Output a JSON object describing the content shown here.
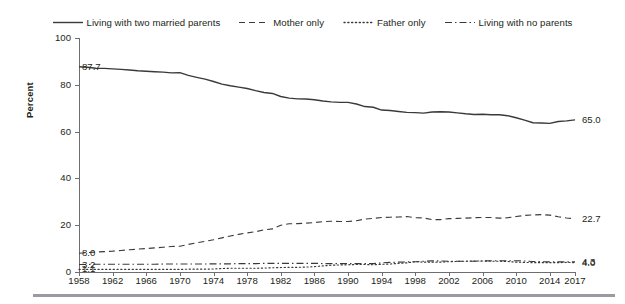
{
  "legend": {
    "items": [
      {
        "label": "Living with two married parents",
        "style": "solid",
        "icon": "solid-line-icon"
      },
      {
        "label": "Mother only",
        "style": "dashed",
        "icon": "dashed-line-icon"
      },
      {
        "label": "Father only",
        "style": "dotted",
        "icon": "dotted-line-icon"
      },
      {
        "label": "Living with no parents",
        "style": "dashdot",
        "icon": "dash-dot-line-icon"
      }
    ]
  },
  "axes": {
    "ylabel": "Percent",
    "yticks": [
      "0",
      "20",
      "40",
      "60",
      "80",
      "100"
    ],
    "xticks": [
      "1958",
      "1962",
      "1966",
      "1970",
      "1974",
      "1978",
      "1982",
      "1986",
      "1990",
      "1994",
      "1998",
      "2002",
      "2006",
      "2010",
      "2014",
      "2017"
    ]
  },
  "endpoint_labels": {
    "left": [
      {
        "series": "Living with two married parents",
        "value": "87.7"
      },
      {
        "series": "Mother only",
        "value": "8.0"
      },
      {
        "series": "Living with no parents",
        "value": "3.2"
      },
      {
        "series": "Father only",
        "value": "1.1"
      }
    ],
    "right": [
      {
        "series": "Living with two married parents",
        "value": "65.0"
      },
      {
        "series": "Mother only",
        "value": "22.7"
      },
      {
        "series": "Living with no parents",
        "value": "4.3"
      },
      {
        "series": "Father only",
        "value": "4.0"
      }
    ]
  },
  "colors": {
    "line": "#3a3a3a",
    "axis": "#6d6e71",
    "text": "#231f20",
    "rule": "#9a9b9e",
    "background": "#ffffff"
  },
  "chart_data": {
    "type": "line",
    "title": "",
    "subtitle": "",
    "xlabel": "",
    "ylabel": "Percent",
    "xlim": [
      1958,
      2017
    ],
    "ylim": [
      0,
      100
    ],
    "grid": false,
    "legend_position": "top-center",
    "x": [
      1958,
      1959,
      1960,
      1961,
      1962,
      1963,
      1964,
      1965,
      1966,
      1967,
      1968,
      1969,
      1970,
      1971,
      1972,
      1973,
      1974,
      1975,
      1976,
      1977,
      1978,
      1979,
      1980,
      1981,
      1982,
      1983,
      1984,
      1985,
      1986,
      1987,
      1988,
      1989,
      1990,
      1991,
      1992,
      1993,
      1994,
      1995,
      1996,
      1997,
      1998,
      1999,
      2000,
      2001,
      2002,
      2003,
      2004,
      2005,
      2006,
      2007,
      2008,
      2009,
      2010,
      2011,
      2012,
      2013,
      2014,
      2015,
      2016,
      2017
    ],
    "series": [
      {
        "name": "Living with two married parents",
        "style": "solid",
        "start_value": 87.7,
        "end_value": 65.0,
        "values": [
          87.7,
          87.5,
          87.1,
          87.0,
          86.8,
          86.6,
          86.3,
          86.0,
          85.8,
          85.6,
          85.4,
          85.1,
          85.2,
          84.0,
          83.2,
          82.4,
          81.4,
          80.3,
          79.6,
          79.0,
          78.4,
          77.5,
          76.7,
          76.3,
          75.0,
          74.3,
          74.0,
          73.9,
          73.6,
          73.1,
          72.7,
          72.5,
          72.5,
          71.8,
          70.7,
          70.4,
          69.2,
          69.0,
          68.6,
          68.2,
          68.1,
          67.9,
          68.4,
          68.5,
          68.4,
          68.0,
          67.6,
          67.3,
          67.4,
          67.2,
          67.2,
          66.8,
          65.9,
          64.9,
          63.8,
          63.7,
          63.5,
          64.3,
          64.6,
          65.0
        ]
      },
      {
        "name": "Mother only",
        "style": "dashed",
        "start_value": 8.0,
        "end_value": 22.7,
        "values": [
          8.0,
          8.3,
          8.5,
          8.7,
          8.9,
          9.2,
          9.5,
          9.8,
          10.0,
          10.3,
          10.6,
          10.9,
          11.0,
          11.8,
          12.5,
          13.1,
          13.8,
          14.6,
          15.4,
          16.1,
          16.7,
          17.2,
          18.0,
          18.4,
          20.0,
          20.6,
          20.7,
          20.9,
          21.1,
          21.5,
          21.7,
          21.6,
          21.6,
          21.9,
          22.6,
          22.9,
          23.3,
          23.4,
          23.5,
          23.7,
          23.2,
          23.1,
          22.4,
          22.4,
          22.8,
          22.9,
          23.0,
          23.2,
          23.3,
          23.3,
          23.0,
          23.2,
          23.7,
          24.2,
          24.4,
          24.5,
          24.3,
          23.6,
          23.1,
          22.7
        ]
      },
      {
        "name": "Father only",
        "style": "dotted",
        "start_value": 1.1,
        "end_value": 4.0,
        "values": [
          1.1,
          1.1,
          1.1,
          1.1,
          1.1,
          1.1,
          1.1,
          1.1,
          1.1,
          1.1,
          1.1,
          1.1,
          1.1,
          1.2,
          1.2,
          1.2,
          1.3,
          1.5,
          1.6,
          1.6,
          1.6,
          1.6,
          1.7,
          1.8,
          1.9,
          2.0,
          2.0,
          2.1,
          2.3,
          2.6,
          2.9,
          3.0,
          3.1,
          3.2,
          3.2,
          3.1,
          3.3,
          3.4,
          3.7,
          3.9,
          4.4,
          4.2,
          4.2,
          4.2,
          4.4,
          4.5,
          4.6,
          4.7,
          4.7,
          4.6,
          4.6,
          4.5,
          4.2,
          4.1,
          4.0,
          4.0,
          4.0,
          4.0,
          4.1,
          4.0
        ]
      },
      {
        "name": "Living with no parents",
        "style": "dashdot",
        "start_value": 3.2,
        "end_value": 4.3,
        "values": [
          3.2,
          3.2,
          3.3,
          3.3,
          3.3,
          3.3,
          3.3,
          3.3,
          3.3,
          3.3,
          3.4,
          3.4,
          3.4,
          3.4,
          3.4,
          3.4,
          3.5,
          3.5,
          3.5,
          3.6,
          3.6,
          3.6,
          3.7,
          3.7,
          3.7,
          3.7,
          3.7,
          3.7,
          3.7,
          3.6,
          3.6,
          3.6,
          3.6,
          3.6,
          3.6,
          3.6,
          3.9,
          4.1,
          4.2,
          4.3,
          4.4,
          4.6,
          4.8,
          4.7,
          4.6,
          4.6,
          4.6,
          4.6,
          4.7,
          4.8,
          4.8,
          4.8,
          4.8,
          4.7,
          4.5,
          4.4,
          4.3,
          4.3,
          4.3,
          4.3
        ]
      }
    ]
  }
}
